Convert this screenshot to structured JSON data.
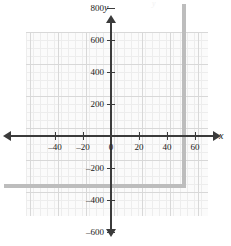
{
  "chart_data": {
    "type": "grid",
    "title": "",
    "subtitle": "",
    "xlabel": "x",
    "ylabel": "y",
    "xlim": [
      -50,
      62
    ],
    "ylim": [
      -1000,
      1300
    ],
    "grid": true,
    "legend": null,
    "annotations": [],
    "series": [],
    "x_ticks": [
      {
        "value": -40,
        "label": "–40"
      },
      {
        "value": -20,
        "label": "–20"
      },
      {
        "value": 0,
        "label": "0"
      },
      {
        "value": 20,
        "label": "20"
      },
      {
        "value": 40,
        "label": "40"
      },
      {
        "value": 60,
        "label": "60"
      }
    ],
    "y_ticks": [
      {
        "value": 1200,
        "label": "1200"
      },
      {
        "value": 1000,
        "label": "1000"
      },
      {
        "value": 800,
        "label": "800"
      },
      {
        "value": 600,
        "label": "600"
      },
      {
        "value": 400,
        "label": "400"
      },
      {
        "value": 200,
        "label": "200"
      },
      {
        "value": -200,
        "label": "–200"
      },
      {
        "value": -400,
        "label": "–400"
      },
      {
        "value": -600,
        "label": "–600"
      },
      {
        "value": -800,
        "label": "–800"
      },
      {
        "value": -1000,
        "label": "–1000"
      }
    ],
    "x_major_step": 20,
    "y_major_step": 200,
    "x_minor_step": 5,
    "y_minor_step": 50,
    "colors": {
      "axis": "#3b3b3b",
      "grid_major": "#d8d8d8",
      "grid_minor": "#ededed",
      "panel": "#fbfbfb",
      "shadow": "#bdbdbd",
      "text": "#1a1a1a"
    }
  },
  "artifact": {
    "top_text": "y"
  }
}
